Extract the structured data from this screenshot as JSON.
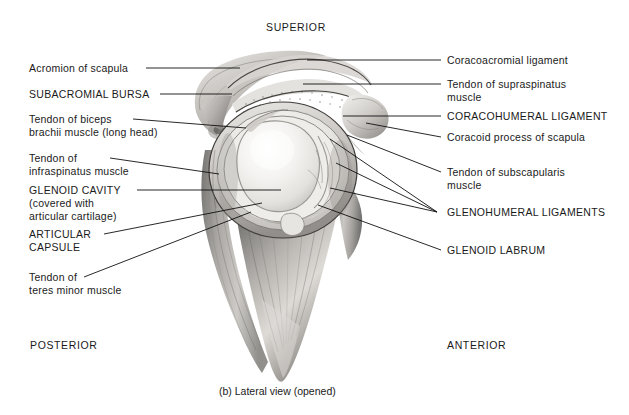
{
  "figure": {
    "caption": "(b) Lateral view (opened)",
    "orientation": {
      "superior": "SUPERIOR",
      "posterior": "POSTERIOR",
      "anterior": "ANTERIOR"
    },
    "illustration_name": "shoulder-joint-lateral-view-opened",
    "colors": {
      "ink": "#1a1a1a",
      "leader_line": "#111111",
      "background": "#ffffff",
      "bone_light": "#f2f1ef",
      "bone_mid": "#cfcdc9",
      "bone_shadow": "#8d8b88",
      "cartilage": "#e8e7e4",
      "muscle_mid": "#b9b7b3",
      "muscle_dark": "#7e7c79"
    }
  },
  "labels_left": [
    {
      "id": "acromion-of-scapula",
      "text": "Acromion of scapula",
      "style": "sentence"
    },
    {
      "id": "subacromial-bursa",
      "text": "SUBACROMIAL BURSA",
      "style": "caps"
    },
    {
      "id": "tendon-of-biceps-brachii-muscle",
      "line1": "Tendon of biceps",
      "line2": "brachii muscle (long head)",
      "style": "sentence"
    },
    {
      "id": "tendon-of-infraspinatus-muscle",
      "line1": "Tendon of",
      "line2": "infraspinatus muscle",
      "style": "sentence"
    },
    {
      "id": "glenoid-cavity",
      "line1": "GLENOID CAVITY",
      "line2": "(covered with",
      "line3": "articular cartilage)",
      "style": "caps"
    },
    {
      "id": "articular-capsule",
      "line1": "ARTICULAR",
      "line2": "CAPSULE",
      "style": "caps"
    },
    {
      "id": "tendon-of-teres-minor-muscle",
      "line1": "Tendon of",
      "line2": "teres minor muscle",
      "style": "sentence"
    }
  ],
  "labels_right": [
    {
      "id": "coracoacromial-ligament",
      "text": "Coracoacromial ligament",
      "style": "sentence"
    },
    {
      "id": "tendon-of-supraspinatus-muscle",
      "line1": "Tendon of supraspinatus",
      "line2": "muscle",
      "style": "sentence"
    },
    {
      "id": "coracohumeral-ligament",
      "text": "CORACOHUMERAL LIGAMENT",
      "style": "caps"
    },
    {
      "id": "coracoid-process-of-scapula",
      "text": "Coracoid process of scapula",
      "style": "sentence"
    },
    {
      "id": "tendon-of-subscapularis-muscle",
      "line1": "Tendon of subscapularis",
      "line2": "muscle",
      "style": "sentence"
    },
    {
      "id": "glenohumeral-ligaments",
      "text": "GLENOHUMERAL LIGAMENTS",
      "style": "caps"
    },
    {
      "id": "glenoid-labrum",
      "text": "GLENOID LABRUM",
      "style": "caps"
    }
  ]
}
